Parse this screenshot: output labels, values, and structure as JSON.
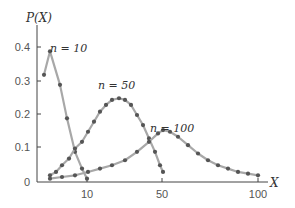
{
  "chart_data": {
    "type": "line",
    "title": "",
    "xlabel": "X",
    "ylabel": "P(X)",
    "x_ticks": [
      "10",
      "50",
      "100"
    ],
    "y_ticks": [
      "0",
      "0.1",
      "0.2",
      "0.3",
      "0.4"
    ],
    "ylim": [
      0,
      0.45
    ],
    "grid": false,
    "legend": "none (inline annotations)",
    "annotations": [
      "n = 10",
      "n = 50",
      "n = 100"
    ],
    "series": [
      {
        "name": "n = 10",
        "points_px": [
          [
            44,
            155
          ],
          [
            50,
            104
          ],
          [
            60,
            132
          ],
          [
            67,
            155
          ],
          [
            75,
            179
          ],
          [
            82,
            195
          ],
          [
            87,
            208
          ]
        ],
        "values": [
          0.32,
          0.39,
          0.29,
          0.19,
          0.09,
          0.04,
          0.01
        ]
      },
      {
        "name": "n = 50",
        "points_px": [
          [
            50,
            196
          ],
          [
            56,
            193
          ],
          [
            62,
            188
          ],
          [
            69,
            182
          ],
          [
            75,
            173
          ],
          [
            82,
            164
          ],
          [
            88,
            154
          ],
          [
            94,
            143
          ],
          [
            100,
            133
          ],
          [
            106,
            124
          ],
          [
            112,
            118
          ],
          [
            119,
            115
          ],
          [
            125,
            116
          ],
          [
            131,
            122
          ],
          [
            137,
            131
          ],
          [
            143,
            142
          ],
          [
            149,
            153
          ],
          [
            155,
            164
          ],
          [
            160,
            174
          ],
          [
            163,
            177
          ]
        ],
        "values": [
          0.02,
          0.03,
          0.05,
          0.07,
          0.1,
          0.12,
          0.15,
          0.18,
          0.21,
          0.23,
          0.245,
          0.25,
          0.245,
          0.23,
          0.2,
          0.17,
          0.13,
          0.09,
          0.05,
          0.03
        ]
      },
      {
        "name": "n = 100",
        "points_px": [
          [
            50,
            202
          ],
          [
            62,
            200
          ],
          [
            75,
            197
          ],
          [
            88,
            194
          ],
          [
            100,
            190
          ],
          [
            112,
            185
          ],
          [
            125,
            178
          ],
          [
            137,
            168
          ],
          [
            149,
            159
          ],
          [
            158,
            153
          ],
          [
            163,
            152
          ],
          [
            170,
            153
          ],
          [
            178,
            158
          ],
          [
            188,
            167
          ],
          [
            198,
            176
          ],
          [
            208,
            183
          ],
          [
            218,
            188
          ],
          [
            228,
            192
          ],
          [
            238,
            195
          ],
          [
            248,
            197
          ],
          [
            258,
            199
          ]
        ],
        "values": [
          0.01,
          0.015,
          0.02,
          0.03,
          0.04,
          0.05,
          0.065,
          0.09,
          0.12,
          0.145,
          0.155,
          0.15,
          0.135,
          0.11,
          0.085,
          0.065,
          0.05,
          0.04,
          0.03,
          0.025,
          0.02
        ]
      }
    ]
  },
  "axes": {
    "x_label": "X",
    "y_label": "P(X)"
  },
  "labels": {
    "n10": "n = 10",
    "n50": "n = 50",
    "n100": "n = 100"
  }
}
